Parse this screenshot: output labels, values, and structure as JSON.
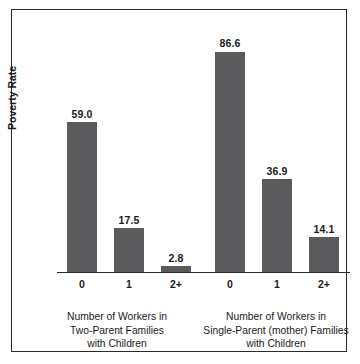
{
  "chart_data": {
    "type": "bar",
    "title": "",
    "xlabel": "",
    "ylabel": "Poverty Rate",
    "ylim": [
      0,
      95
    ],
    "grid": false,
    "legend": "none",
    "categories": [
      "0",
      "1",
      "2+",
      "0",
      "1",
      "2+"
    ],
    "values": [
      59.0,
      17.5,
      2.8,
      86.6,
      36.9,
      14.1
    ],
    "bar_color": "#5a5a5c",
    "groups": [
      {
        "caption_lines": [
          "Number of Workers in",
          "Two-Parent Families",
          "with Children"
        ],
        "categories": [
          "0",
          "1",
          "2+"
        ],
        "values": [
          59.0,
          17.5,
          2.8
        ],
        "value_labels": [
          "59.0",
          "17.5",
          "2.8"
        ]
      },
      {
        "caption_lines": [
          "Number of Workers in",
          "Single-Parent (mother) Families",
          "with Children"
        ],
        "categories": [
          "0",
          "1",
          "2+"
        ],
        "values": [
          86.6,
          36.9,
          14.1
        ],
        "value_labels": [
          "86.6",
          "36.9",
          "14.1"
        ]
      }
    ]
  },
  "axis": {
    "y_label": "Poverty Rate"
  },
  "bars": [
    {
      "label": "59.0",
      "tick": "0",
      "value": 59.0,
      "left": 10,
      "width": 30
    },
    {
      "label": "17.5",
      "tick": "1",
      "value": 17.5,
      "left": 57,
      "width": 30
    },
    {
      "label": "2.8",
      "tick": "2+",
      "value": 2.8,
      "left": 104,
      "width": 30
    },
    {
      "label": "86.6",
      "tick": "0",
      "value": 86.6,
      "left": 158,
      "width": 30
    },
    {
      "label": "36.9",
      "tick": "1",
      "value": 36.9,
      "left": 205,
      "width": 30
    },
    {
      "label": "14.1",
      "tick": "2+",
      "value": 14.1,
      "left": 252,
      "width": 30
    }
  ],
  "captions": {
    "left": {
      "line1": "Number of Workers in",
      "line2": "Two-Parent Families",
      "line3": "with Children"
    },
    "right": {
      "line1": "Number of Workers in",
      "line2": "Single-Parent (mother) Families",
      "line3": "with Children"
    }
  }
}
